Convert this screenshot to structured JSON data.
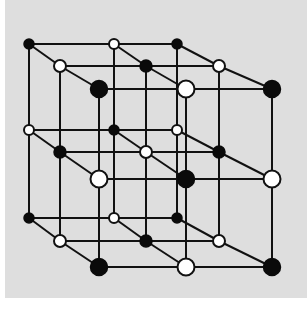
{
  "diagram": {
    "title": "",
    "colors": {
      "background": "#dedede",
      "page": "#ffffff",
      "black_atom": "#0a0a0a",
      "white_atom": "#ffffff",
      "bond": "#111111"
    },
    "grid": {
      "x_cols": [
        [
          29,
          114,
          177
        ],
        [
          60,
          146,
          219
        ],
        [
          99,
          186,
          272
        ]
      ],
      "y_rows": [
        [
          44,
          130,
          218
        ],
        [
          66,
          152,
          241
        ],
        [
          89,
          179,
          267
        ]
      ],
      "radius_by_depth": [
        5,
        6,
        8.5
      ]
    },
    "atoms": [
      {
        "depth": 0,
        "row": 0,
        "col": 0,
        "color": "black"
      },
      {
        "depth": 0,
        "row": 0,
        "col": 1,
        "color": "white"
      },
      {
        "depth": 0,
        "row": 0,
        "col": 2,
        "color": "black"
      },
      {
        "depth": 0,
        "row": 1,
        "col": 0,
        "color": "white"
      },
      {
        "depth": 0,
        "row": 1,
        "col": 1,
        "color": "black"
      },
      {
        "depth": 0,
        "row": 1,
        "col": 2,
        "color": "white"
      },
      {
        "depth": 0,
        "row": 2,
        "col": 0,
        "color": "black"
      },
      {
        "depth": 0,
        "row": 2,
        "col": 1,
        "color": "white"
      },
      {
        "depth": 0,
        "row": 2,
        "col": 2,
        "color": "black"
      },
      {
        "depth": 1,
        "row": 0,
        "col": 0,
        "color": "white"
      },
      {
        "depth": 1,
        "row": 0,
        "col": 1,
        "color": "black"
      },
      {
        "depth": 1,
        "row": 0,
        "col": 2,
        "color": "white"
      },
      {
        "depth": 1,
        "row": 1,
        "col": 0,
        "color": "black"
      },
      {
        "depth": 1,
        "row": 1,
        "col": 1,
        "color": "white"
      },
      {
        "depth": 1,
        "row": 1,
        "col": 2,
        "color": "black"
      },
      {
        "depth": 1,
        "row": 2,
        "col": 0,
        "color": "white"
      },
      {
        "depth": 1,
        "row": 2,
        "col": 1,
        "color": "black"
      },
      {
        "depth": 1,
        "row": 2,
        "col": 2,
        "color": "white"
      },
      {
        "depth": 2,
        "row": 0,
        "col": 0,
        "color": "black"
      },
      {
        "depth": 2,
        "row": 0,
        "col": 1,
        "color": "white"
      },
      {
        "depth": 2,
        "row": 0,
        "col": 2,
        "color": "black"
      },
      {
        "depth": 2,
        "row": 1,
        "col": 0,
        "color": "white"
      },
      {
        "depth": 2,
        "row": 1,
        "col": 1,
        "color": "black"
      },
      {
        "depth": 2,
        "row": 1,
        "col": 2,
        "color": "white"
      },
      {
        "depth": 2,
        "row": 2,
        "col": 0,
        "color": "black"
      },
      {
        "depth": 2,
        "row": 2,
        "col": 1,
        "color": "white"
      },
      {
        "depth": 2,
        "row": 2,
        "col": 2,
        "color": "black"
      }
    ]
  }
}
